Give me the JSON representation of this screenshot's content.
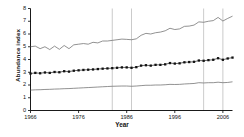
{
  "figure": {
    "ylabel": "Abundance index",
    "xlabel": "Year",
    "caption": "Figure 1. Bird Survey Trend index (Abundance)",
    "axis_color": "#000000",
    "line_color": "#6e6e6e",
    "marker_color": "#111111",
    "grid_color": "#b5b5b5",
    "background": "#ffffff"
  },
  "yticks": [
    {
      "label": "0",
      "value": 0
    },
    {
      "label": "1",
      "value": 1
    },
    {
      "label": "2",
      "value": 2
    },
    {
      "label": "3",
      "value": 3
    },
    {
      "label": "4",
      "value": 4
    },
    {
      "label": "5",
      "value": 5
    },
    {
      "label": "6",
      "value": 6
    },
    {
      "label": "7",
      "value": 7
    },
    {
      "label": "8",
      "value": 8
    }
  ],
  "xticks": [
    {
      "label": "1966",
      "value": 1966
    },
    {
      "label": "1976",
      "value": 1976
    },
    {
      "label": "1986",
      "value": 1986
    },
    {
      "label": "1996",
      "value": 1996
    },
    {
      "label": "2006",
      "value": 2006
    }
  ],
  "chart_data": {
    "type": "line",
    "title": "",
    "xlabel": "Year",
    "ylabel": "Abundance index",
    "xlim": [
      1966,
      2008
    ],
    "ylim": [
      0,
      8
    ],
    "grid": "vertical",
    "legend": "none",
    "x": [
      1966,
      1967,
      1968,
      1969,
      1970,
      1971,
      1972,
      1973,
      1974,
      1975,
      1976,
      1977,
      1978,
      1979,
      1980,
      1981,
      1982,
      1983,
      1984,
      1985,
      1986,
      1987,
      1988,
      1989,
      1990,
      1991,
      1992,
      1993,
      1994,
      1995,
      1996,
      1997,
      1998,
      1999,
      2000,
      2001,
      2002,
      2003,
      2004,
      2005,
      2006,
      2007,
      2008
    ],
    "vertical_gridlines": [
      1983,
      1987,
      2002,
      2006
    ],
    "series": [
      {
        "name": "Upper confidence limit",
        "style": "line",
        "values": [
          5.0,
          5.05,
          4.85,
          5.0,
          4.78,
          5.05,
          4.8,
          5.1,
          4.85,
          5.15,
          5.2,
          5.25,
          5.2,
          5.35,
          5.3,
          5.45,
          5.45,
          5.5,
          5.55,
          5.6,
          5.58,
          5.55,
          5.62,
          5.9,
          6.05,
          6.0,
          6.1,
          6.15,
          6.25,
          6.45,
          6.35,
          6.4,
          6.6,
          6.62,
          6.7,
          6.95,
          6.92,
          7.0,
          7.05,
          7.3,
          7.02,
          7.22,
          7.4
        ]
      },
      {
        "name": "Abundance index",
        "style": "line-markers",
        "values": [
          2.9,
          2.95,
          2.92,
          2.98,
          2.95,
          3.02,
          3.0,
          3.08,
          3.05,
          3.12,
          3.15,
          3.18,
          3.2,
          3.22,
          3.25,
          3.28,
          3.3,
          3.32,
          3.35,
          3.38,
          3.38,
          3.35,
          3.4,
          3.52,
          3.55,
          3.52,
          3.58,
          3.58,
          3.62,
          3.72,
          3.68,
          3.7,
          3.78,
          3.8,
          3.82,
          3.92,
          3.9,
          3.95,
          3.98,
          4.1,
          3.98,
          4.08,
          4.15
        ]
      },
      {
        "name": "Lower confidence limit",
        "style": "line",
        "values": [
          1.6,
          1.62,
          1.63,
          1.65,
          1.66,
          1.68,
          1.69,
          1.71,
          1.72,
          1.74,
          1.76,
          1.78,
          1.8,
          1.82,
          1.84,
          1.86,
          1.88,
          1.9,
          1.91,
          1.92,
          1.92,
          1.9,
          1.92,
          1.95,
          1.98,
          1.98,
          2.0,
          2.0,
          2.02,
          2.05,
          2.04,
          2.05,
          2.08,
          2.1,
          2.12,
          2.18,
          2.16,
          2.18,
          2.18,
          2.22,
          2.18,
          2.2,
          2.25
        ]
      }
    ]
  }
}
